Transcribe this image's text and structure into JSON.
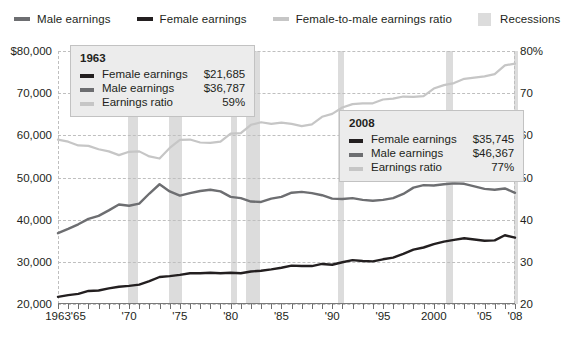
{
  "legend": {
    "items": [
      {
        "label": "Male earnings",
        "icon": "line-swatch-icon",
        "color": "#6d6e71",
        "type": "line"
      },
      {
        "label": "Female earnings",
        "icon": "line-swatch-icon",
        "color": "#231f20",
        "type": "line"
      },
      {
        "label": "Female-to-male earnings ratio",
        "icon": "line-swatch-icon",
        "color": "#c6c6c6",
        "type": "line"
      },
      {
        "label": "Recessions",
        "icon": "box-swatch-icon",
        "color": "#dcdcdc",
        "type": "box"
      }
    ]
  },
  "axes": {
    "left": {
      "labels": [
        "$80,000",
        "70,000",
        "60,000",
        "50,000",
        "40,000",
        "30,000",
        "20,000"
      ],
      "values": [
        80000,
        70000,
        60000,
        50000,
        40000,
        30000,
        20000
      ],
      "min": 20000,
      "max": 80000
    },
    "right": {
      "labels": [
        "80%",
        "70",
        "60",
        "50",
        "40",
        "30",
        "20"
      ],
      "values": [
        80,
        70,
        60,
        50,
        40,
        30,
        20
      ],
      "min": 20,
      "max": 80
    },
    "bottom": {
      "labels": [
        {
          "text": "1963",
          "year": 1963
        },
        {
          "text": "'65",
          "year": 1965
        },
        {
          "text": "'70",
          "year": 1970
        },
        {
          "text": "'75",
          "year": 1975
        },
        {
          "text": "'80",
          "year": 1980
        },
        {
          "text": "'85",
          "year": 1985
        },
        {
          "text": "'90",
          "year": 1990
        },
        {
          "text": "'95",
          "year": 1995
        },
        {
          "text": "2000",
          "year": 2000
        },
        {
          "text": "'05",
          "year": 2005
        },
        {
          "text": "'08",
          "year": 2008
        }
      ],
      "min": 1963,
      "max": 2008
    }
  },
  "callouts": [
    {
      "year": "1963",
      "rows": [
        {
          "label": "Female earnings",
          "value": "$21,685",
          "color": "#231f20"
        },
        {
          "label": "Male earnings",
          "value": "$36,787",
          "color": "#6d6e71"
        },
        {
          "label": "Earnings ratio",
          "value": "59%",
          "color": "#c6c6c6"
        }
      ]
    },
    {
      "year": "2008",
      "rows": [
        {
          "label": "Female earnings",
          "value": "$35,745",
          "color": "#231f20"
        },
        {
          "label": "Male earnings",
          "value": "$46,367",
          "color": "#6d6e71"
        },
        {
          "label": "Earnings ratio",
          "value": "77%",
          "color": "#c6c6c6"
        }
      ]
    }
  ],
  "footnote": "",
  "chart_data": {
    "type": "line",
    "title": "",
    "xlabel": "",
    "ylabel": "Earnings (2008 dollars)",
    "y2label": "Female-to-male earnings ratio (percent)",
    "xlim": [
      1963,
      2008
    ],
    "ylim": [
      20000,
      80000
    ],
    "y2lim": [
      20,
      80
    ],
    "grid": true,
    "legend_position": "top",
    "x": [
      1963,
      1964,
      1965,
      1966,
      1967,
      1968,
      1969,
      1970,
      1971,
      1972,
      1973,
      1974,
      1975,
      1976,
      1977,
      1978,
      1979,
      1980,
      1981,
      1982,
      1983,
      1984,
      1985,
      1986,
      1987,
      1988,
      1989,
      1990,
      1991,
      1992,
      1993,
      1994,
      1995,
      1996,
      1997,
      1998,
      1999,
      2000,
      2001,
      2002,
      2003,
      2004,
      2005,
      2006,
      2007,
      2008
    ],
    "series": [
      {
        "name": "Male earnings",
        "color": "#6d6e71",
        "axis": "left",
        "values": [
          36787,
          37800,
          38900,
          40200,
          40900,
          42200,
          43600,
          43300,
          43800,
          46200,
          48400,
          46700,
          45700,
          46300,
          46800,
          47100,
          46700,
          45400,
          45100,
          44300,
          44200,
          45000,
          45400,
          46400,
          46600,
          46300,
          45800,
          45000,
          44900,
          45100,
          44700,
          44500,
          44700,
          45100,
          46100,
          47600,
          48200,
          48100,
          48400,
          48600,
          48500,
          47900,
          47300,
          47100,
          47400,
          46367
        ],
        "start_value": 36787,
        "end_value": 46367
      },
      {
        "name": "Female earnings",
        "color": "#231f20",
        "axis": "left",
        "values": [
          21685,
          22100,
          22400,
          23100,
          23200,
          23700,
          24100,
          24300,
          24600,
          25400,
          26400,
          26600,
          26900,
          27300,
          27300,
          27400,
          27300,
          27400,
          27300,
          27700,
          27900,
          28200,
          28600,
          29100,
          29000,
          29000,
          29500,
          29300,
          29900,
          30400,
          30200,
          30100,
          30600,
          31000,
          31900,
          32900,
          33400,
          34200,
          34800,
          35200,
          35600,
          35300,
          35000,
          35100,
          36300,
          35745
        ],
        "start_value": 21685,
        "end_value": 35745
      },
      {
        "name": "Female-to-male earnings ratio",
        "color": "#c6c6c6",
        "axis": "right",
        "values": [
          59.0,
          58.5,
          57.6,
          57.5,
          56.7,
          56.2,
          55.3,
          56.1,
          56.2,
          55.0,
          54.5,
          57.0,
          58.9,
          59.0,
          58.3,
          58.2,
          58.5,
          60.4,
          60.5,
          62.5,
          63.1,
          62.7,
          63.0,
          62.7,
          62.2,
          62.6,
          64.4,
          65.1,
          66.6,
          67.4,
          67.6,
          67.6,
          68.5,
          68.7,
          69.2,
          69.1,
          69.3,
          71.1,
          71.9,
          72.4,
          73.4,
          73.7,
          74.0,
          74.5,
          76.6,
          77.0
        ],
        "start_value": 59,
        "end_value": 77
      }
    ],
    "recessions": [
      {
        "start": 1969.9,
        "end": 1970.9
      },
      {
        "start": 1973.9,
        "end": 1975.2
      },
      {
        "start": 1980.0,
        "end": 1980.6
      },
      {
        "start": 1981.5,
        "end": 1982.9
      },
      {
        "start": 1990.6,
        "end": 1991.2
      },
      {
        "start": 2001.2,
        "end": 2001.9
      },
      {
        "start": 2007.9,
        "end": 2008.3
      }
    ]
  }
}
